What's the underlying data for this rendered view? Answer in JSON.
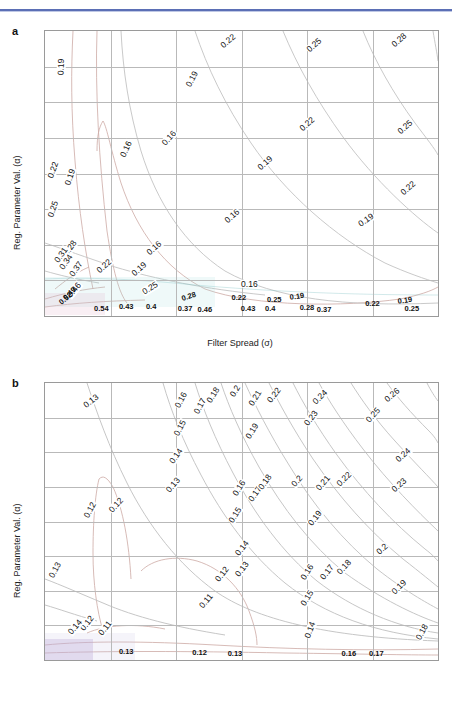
{
  "figure": {
    "panel_a_letter": "a",
    "panel_b_letter": "b",
    "xlabel": "Filter Spread (σ)",
    "ylabel": "Reg. Parameter Val. (α)",
    "xticks": [
      "0.5",
      "1",
      "1.5",
      "2",
      "2.5",
      "3",
      "3.5"
    ],
    "yticks": [
      "5",
      "10",
      "15",
      "20",
      "25",
      "30",
      "35",
      "40"
    ],
    "contour_line_color": "#c9a9a4",
    "contour_line_color_alt": "#bfbfbf",
    "grid_color": "#b9b9b9",
    "axis_color": "#9a9a9a",
    "header_rule_color": "#5b6fb5"
  },
  "chart_data": [
    {
      "type": "contour",
      "panel": "a",
      "title": "",
      "xlabel": "Filter Spread (σ)",
      "ylabel": "Reg. Parameter Val. (α)",
      "xlim": [
        0.5,
        3.5
      ],
      "ylim": [
        0,
        40
      ],
      "xticks": [
        0.5,
        1,
        1.5,
        2,
        2.5,
        3,
        3.5
      ],
      "yticks": [
        5,
        10,
        15,
        20,
        25,
        30,
        35,
        40
      ],
      "grid": true,
      "legend": "none",
      "levels": [
        0.16,
        0.19,
        0.22,
        0.25,
        0.28,
        0.31,
        0.34,
        0.37,
        0.4,
        0.43,
        0.46,
        0.49,
        0.52,
        0.54
      ],
      "labels": [
        {
          "text": "0.19",
          "x": 0.62,
          "y": 35.0,
          "rot": -88
        },
        {
          "text": "0.22",
          "x": 1.9,
          "y": 38.6,
          "rot": -40
        },
        {
          "text": "0.25",
          "x": 2.55,
          "y": 38.0,
          "rot": -42
        },
        {
          "text": "0.28",
          "x": 3.2,
          "y": 38.8,
          "rot": -42
        },
        {
          "text": "0.19",
          "x": 1.62,
          "y": 33.2,
          "rot": -62
        },
        {
          "text": "0.22",
          "x": 2.5,
          "y": 27.0,
          "rot": -42
        },
        {
          "text": "0.25",
          "x": 3.25,
          "y": 26.5,
          "rot": -42
        },
        {
          "text": "0.16",
          "x": 1.12,
          "y": 23.5,
          "rot": -65
        },
        {
          "text": "0.16",
          "x": 1.45,
          "y": 25.0,
          "rot": -48
        },
        {
          "text": "0.19",
          "x": 2.18,
          "y": 21.5,
          "rot": -42
        },
        {
          "text": "0.22",
          "x": 0.56,
          "y": 20.5,
          "rot": -70
        },
        {
          "text": "0.19",
          "x": 0.69,
          "y": 19.5,
          "rot": -72
        },
        {
          "text": "0.25",
          "x": 0.56,
          "y": 15.0,
          "rot": -72
        },
        {
          "text": "0.22",
          "x": 3.27,
          "y": 18.0,
          "rot": -42
        },
        {
          "text": "0.16",
          "x": 1.93,
          "y": 14.0,
          "rot": -42
        },
        {
          "text": "0.19",
          "x": 2.95,
          "y": 13.5,
          "rot": -35
        },
        {
          "text": "0.28",
          "x": 0.69,
          "y": 9.6,
          "rot": -55
        },
        {
          "text": "0.31",
          "x": 0.62,
          "y": 8.6,
          "rot": -55
        },
        {
          "text": "0.34",
          "x": 0.66,
          "y": 7.6,
          "rot": -55
        },
        {
          "text": "0.37",
          "x": 0.74,
          "y": 6.6,
          "rot": -55
        },
        {
          "text": "0.16",
          "x": 1.33,
          "y": 9.6,
          "rot": -42
        },
        {
          "text": "0.22",
          "x": 0.95,
          "y": 7.0,
          "rot": -42
        },
        {
          "text": "0.19",
          "x": 1.22,
          "y": 6.6,
          "rot": -42
        },
        {
          "text": "0.25",
          "x": 1.3,
          "y": 4.0,
          "rot": -32
        },
        {
          "text": "0.16",
          "x": 2.06,
          "y": 4.5,
          "rot": 0
        },
        {
          "text": "0.46",
          "x": 0.72,
          "y": 3.7,
          "rot": -50
        },
        {
          "text": "0.49",
          "x": 0.69,
          "y": 3.1,
          "rot": -45
        },
        {
          "text": "0.52",
          "x": 0.66,
          "y": 2.4,
          "rot": -40
        },
        {
          "text": "0.28",
          "x": 1.6,
          "y": 2.6,
          "rot": -18
        },
        {
          "text": "0.22",
          "x": 1.98,
          "y": 2.5,
          "rot": 0
        },
        {
          "text": "0.25",
          "x": 2.25,
          "y": 2.3,
          "rot": 0
        },
        {
          "text": "0.19",
          "x": 2.42,
          "y": 2.6,
          "rot": -8
        },
        {
          "text": "0.22",
          "x": 3.0,
          "y": 1.7,
          "rot": 0
        },
        {
          "text": "0.19",
          "x": 3.25,
          "y": 2.1,
          "rot": -8
        },
        {
          "text": "0.25",
          "x": 3.3,
          "y": 1.0,
          "rot": 0
        },
        {
          "text": "0.54",
          "x": 0.93,
          "y": 1.0,
          "rot": 0
        },
        {
          "text": "0.43",
          "x": 1.12,
          "y": 1.2,
          "rot": 0
        },
        {
          "text": "0.4",
          "x": 1.31,
          "y": 1.2,
          "rot": 0
        },
        {
          "text": "0.37",
          "x": 1.57,
          "y": 1.0,
          "rot": 0
        },
        {
          "text": "0.46",
          "x": 1.72,
          "y": 0.9,
          "rot": 0
        },
        {
          "text": "0.43",
          "x": 2.05,
          "y": 1.0,
          "rot": 0
        },
        {
          "text": "0.4",
          "x": 2.22,
          "y": 1.0,
          "rot": 0
        },
        {
          "text": "0.28",
          "x": 2.5,
          "y": 1.1,
          "rot": 0
        },
        {
          "text": "0.37",
          "x": 2.63,
          "y": 0.9,
          "rot": 0
        }
      ]
    },
    {
      "type": "contour",
      "panel": "b",
      "title": "",
      "xlabel": "Filter Spread (σ)",
      "ylabel": "Reg. Parameter Val. (α)",
      "xlim": [
        0.5,
        3.5
      ],
      "ylim": [
        0,
        40
      ],
      "xticks": [
        0.5,
        1,
        1.5,
        2,
        2.5,
        3,
        3.5
      ],
      "yticks": [
        5,
        10,
        15,
        20,
        25,
        30,
        35,
        40
      ],
      "grid": true,
      "legend": "none",
      "levels": [
        0.11,
        0.12,
        0.13,
        0.14,
        0.15,
        0.16,
        0.17,
        0.18,
        0.19,
        0.2,
        0.21,
        0.22,
        0.23,
        0.24,
        0.25,
        0.26
      ],
      "labels": [
        {
          "text": "0.13",
          "x": 0.85,
          "y": 37.4,
          "rot": -38
        },
        {
          "text": "0.16",
          "x": 1.54,
          "y": 37.6,
          "rot": -62
        },
        {
          "text": "0.17",
          "x": 1.68,
          "y": 36.7,
          "rot": -62
        },
        {
          "text": "0.18",
          "x": 1.78,
          "y": 38.2,
          "rot": -58
        },
        {
          "text": "0.2",
          "x": 1.95,
          "y": 38.8,
          "rot": -58
        },
        {
          "text": "0.21",
          "x": 2.1,
          "y": 37.8,
          "rot": -58
        },
        {
          "text": "0.22",
          "x": 2.25,
          "y": 38.3,
          "rot": -52
        },
        {
          "text": "0.24",
          "x": 2.6,
          "y": 38.0,
          "rot": -45
        },
        {
          "text": "0.26",
          "x": 3.15,
          "y": 38.2,
          "rot": -40
        },
        {
          "text": "0.15",
          "x": 1.53,
          "y": 33.5,
          "rot": -62
        },
        {
          "text": "0.19",
          "x": 2.08,
          "y": 33.0,
          "rot": -58
        },
        {
          "text": "0.23",
          "x": 2.53,
          "y": 34.9,
          "rot": -52
        },
        {
          "text": "0.25",
          "x": 3.0,
          "y": 35.4,
          "rot": -48
        },
        {
          "text": "0.14",
          "x": 1.5,
          "y": 29.5,
          "rot": -55
        },
        {
          "text": "0.24",
          "x": 3.23,
          "y": 29.6,
          "rot": -42
        },
        {
          "text": "0.13",
          "x": 1.48,
          "y": 25.2,
          "rot": -50
        },
        {
          "text": "0.16",
          "x": 1.98,
          "y": 24.8,
          "rot": -58
        },
        {
          "text": "0.17",
          "x": 2.1,
          "y": 24.0,
          "rot": -55
        },
        {
          "text": "0.18",
          "x": 2.18,
          "y": 25.7,
          "rot": -55
        },
        {
          "text": "0.2",
          "x": 2.42,
          "y": 25.8,
          "rot": -48
        },
        {
          "text": "0.21",
          "x": 2.62,
          "y": 25.5,
          "rot": -50
        },
        {
          "text": "0.22",
          "x": 2.78,
          "y": 26.2,
          "rot": -45
        },
        {
          "text": "0.23",
          "x": 3.2,
          "y": 25.3,
          "rot": -42
        },
        {
          "text": "0.12",
          "x": 0.84,
          "y": 21.7,
          "rot": -62
        },
        {
          "text": "0.12",
          "x": 1.04,
          "y": 22.4,
          "rot": -48
        },
        {
          "text": "0.15",
          "x": 1.95,
          "y": 21.0,
          "rot": -58
        },
        {
          "text": "0.19",
          "x": 2.56,
          "y": 20.5,
          "rot": -52
        },
        {
          "text": "0.14",
          "x": 2.0,
          "y": 16.2,
          "rot": -52
        },
        {
          "text": "0.2",
          "x": 3.07,
          "y": 16.0,
          "rot": -42
        },
        {
          "text": "0.13",
          "x": 0.58,
          "y": 13.0,
          "rot": -62
        },
        {
          "text": "0.12",
          "x": 1.85,
          "y": 12.4,
          "rot": -52
        },
        {
          "text": "0.13",
          "x": 2.0,
          "y": 13.2,
          "rot": -52
        },
        {
          "text": "0.16",
          "x": 2.5,
          "y": 12.7,
          "rot": -58
        },
        {
          "text": "0.17",
          "x": 2.65,
          "y": 12.7,
          "rot": -52
        },
        {
          "text": "0.18",
          "x": 2.78,
          "y": 13.5,
          "rot": -48
        },
        {
          "text": "0.19",
          "x": 3.2,
          "y": 10.5,
          "rot": -45
        },
        {
          "text": "0.11",
          "x": 1.73,
          "y": 8.5,
          "rot": -50
        },
        {
          "text": "0.15",
          "x": 2.5,
          "y": 9.0,
          "rot": -58
        },
        {
          "text": "0.12",
          "x": 0.82,
          "y": 5.4,
          "rot": -52
        },
        {
          "text": "0.14",
          "x": 0.73,
          "y": 4.8,
          "rot": -50
        },
        {
          "text": "0.11",
          "x": 0.96,
          "y": 4.6,
          "rot": -52
        },
        {
          "text": "0.14",
          "x": 2.52,
          "y": 4.3,
          "rot": -70
        },
        {
          "text": "0.18",
          "x": 3.38,
          "y": 4.0,
          "rot": -62
        },
        {
          "text": "0.13",
          "x": 1.12,
          "y": 1.2,
          "rot": 0
        },
        {
          "text": "0.12",
          "x": 1.68,
          "y": 1.0,
          "rot": 0
        },
        {
          "text": "0.13",
          "x": 1.95,
          "y": 0.8,
          "rot": 0
        },
        {
          "text": "0.16",
          "x": 2.82,
          "y": 0.9,
          "rot": 0
        },
        {
          "text": "0.17",
          "x": 3.03,
          "y": 0.9,
          "rot": 0
        }
      ]
    }
  ]
}
